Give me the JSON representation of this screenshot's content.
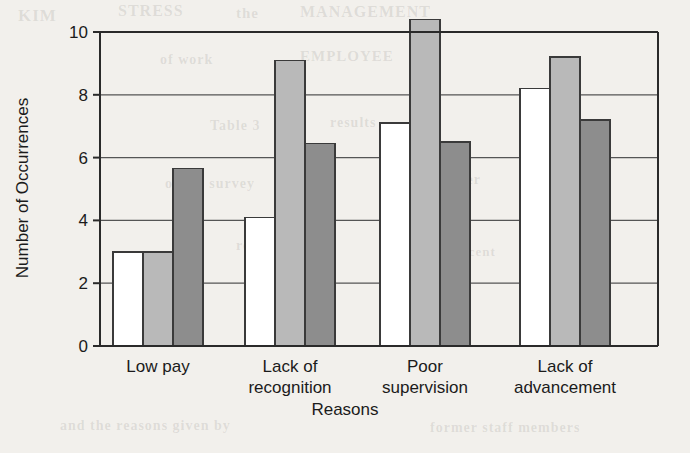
{
  "chart_data": {
    "type": "bar",
    "title": "",
    "subtitle": "",
    "xlabel": "Reasons",
    "ylabel": "Number of Occurrences",
    "categories": [
      "Low pay",
      "Lack of\nrecognition",
      "Poor\nsupervision",
      "Lack of\nadvancement"
    ],
    "category_lines": [
      [
        "Low pay"
      ],
      [
        "Lack of",
        "recognition"
      ],
      [
        "Poor",
        "supervision"
      ],
      [
        "Lack of",
        "advancement"
      ]
    ],
    "series": [
      {
        "name": "series-1",
        "color": "#ffffff",
        "values": [
          3.0,
          4.1,
          7.1,
          8.2
        ]
      },
      {
        "name": "series-2",
        "color": "#b9b9b9",
        "values": [
          3.0,
          9.1,
          10.4,
          9.2
        ]
      },
      {
        "name": "series-3",
        "color": "#8d8d8d",
        "values": [
          5.65,
          6.45,
          6.5,
          7.2
        ]
      }
    ],
    "ylim": [
      0,
      10.6
    ],
    "yticks": [
      0,
      2,
      4,
      6,
      8,
      10
    ],
    "ytick_labels": [
      "0",
      "2",
      "4",
      "6",
      "8",
      "10"
    ],
    "grid": true,
    "grid_axis": "y",
    "legend": "none",
    "bar_outline_color": "#3a3a3a",
    "axis_color": "#2a2a2a"
  },
  "ghost_text": [
    {
      "text": "KIM",
      "x": 18,
      "y": 6,
      "size": 17,
      "rot": 0
    },
    {
      "text": "STRESS",
      "x": 118,
      "y": 2,
      "size": 16,
      "rot": 0
    },
    {
      "text": "the",
      "x": 236,
      "y": 5,
      "size": 15,
      "rot": 0
    },
    {
      "text": "MANAGEMENT",
      "x": 300,
      "y": 3,
      "size": 16,
      "rot": 0
    },
    {
      "text": "of work",
      "x": 160,
      "y": 52,
      "size": 14,
      "rot": 0
    },
    {
      "text": "EMPLOYEE",
      "x": 300,
      "y": 48,
      "size": 15,
      "rot": 0
    },
    {
      "text": "Table 3",
      "x": 210,
      "y": 118,
      "size": 14,
      "rot": 0
    },
    {
      "text": "results",
      "x": 330,
      "y": 115,
      "size": 14,
      "rot": 0
    },
    {
      "text": "of the survey",
      "x": 165,
      "y": 176,
      "size": 14,
      "rot": 0
    },
    {
      "text": "turnover",
      "x": 420,
      "y": 172,
      "size": 14,
      "rot": 0
    },
    {
      "text": "responses",
      "x": 236,
      "y": 238,
      "size": 14,
      "rot": 0
    },
    {
      "text": "in percent",
      "x": 430,
      "y": 244,
      "size": 13,
      "rot": 0
    },
    {
      "text": "and the reasons given by",
      "x": 60,
      "y": 418,
      "size": 14,
      "rot": 0
    },
    {
      "text": "former staff members",
      "x": 430,
      "y": 420,
      "size": 14,
      "rot": 0
    }
  ]
}
